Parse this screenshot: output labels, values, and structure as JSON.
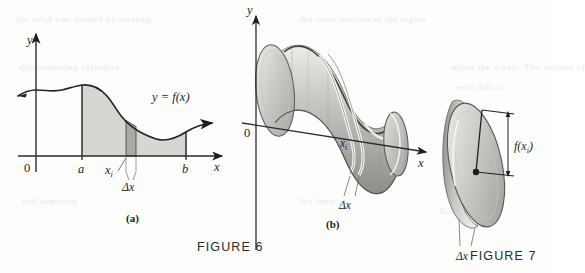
{
  "figure_a": {
    "name": "area-under-curve",
    "axis_y_label": "y",
    "axis_x_label": "x",
    "origin_label": "0",
    "curve_label": "y = f(x)",
    "tick_a": "a",
    "tick_b": "b",
    "tick_xi": "x",
    "tick_xi_sub": "i",
    "delta_label": "Δx",
    "panel_label": "(a)"
  },
  "figure_b": {
    "name": "solid-of-revolution",
    "axis_y_label": "y",
    "axis_x_label": "x",
    "origin_label": "0",
    "slice_label": "x",
    "slice_label_sub": "i",
    "delta_label": "Δx",
    "panel_label": "(b)"
  },
  "figure_c": {
    "name": "disk-slice",
    "radius_label": "f(x",
    "radius_label_sub": "i",
    "radius_label_close": ")",
    "delta_label": "Δx"
  },
  "captions": {
    "figure6": "FIGURE 6",
    "figure7": "FIGURE 7"
  },
  "colors": {
    "shade_fill": "#d6d6d2",
    "strip_fill": "#a9a9a6",
    "ink": "#1f1f1f",
    "solid_light": "#e4e4e0",
    "solid_mid": "#bcbcb8",
    "solid_dark": "#8e8e8a",
    "highlight": "#f7f7f5"
  },
  "chart_data": {
    "type": "area",
    "xlabel": "x",
    "ylabel": "y",
    "series": [
      {
        "name": "y = f(x)",
        "x": [
          0,
          10,
          20,
          30,
          40,
          50,
          60,
          70,
          80,
          90,
          100
        ],
        "y": [
          40,
          46,
          58,
          70,
          76,
          62,
          50,
          42,
          38,
          42,
          46
        ]
      }
    ],
    "region": {
      "from": "a",
      "to": "b",
      "a_x": 30,
      "b_x": 86
    },
    "sample_strip": {
      "label": "x_i",
      "x": 57,
      "width_label": "Δx"
    },
    "grid": false,
    "legend": "none"
  },
  "ghost_text": [
    {
      "t": "the solid was formed by rotating",
      "x": 16,
      "y": 14
    },
    {
      "t": "the cross-section of the region",
      "x": 300,
      "y": 14
    },
    {
      "t": "about the x-axis. The volume of",
      "x": 452,
      "y": 62
    },
    {
      "t": "each disk is",
      "x": 455,
      "y": 82
    },
    {
      "t": "approximating cylinders",
      "x": 18,
      "y": 62
    },
    {
      "t": "and summing",
      "x": 22,
      "y": 196
    },
    {
      "t": "the limit of",
      "x": 300,
      "y": 196
    },
    {
      "t": "Riemann sums",
      "x": 440,
      "y": 206
    }
  ]
}
